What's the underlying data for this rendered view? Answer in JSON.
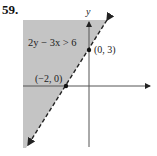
{
  "problem": {
    "number": "59."
  },
  "graph": {
    "inequality": "2y − 3x > 6",
    "axis_labels": {
      "y": "y",
      "x": "x"
    },
    "points": [
      {
        "label": "(0, 3)",
        "x": 0,
        "y": 3
      },
      {
        "label": "(−2, 0)",
        "x": -2,
        "y": 0
      }
    ],
    "boundary_line": {
      "equation": "2y − 3x = 6",
      "style": "dashed"
    },
    "shaded_region": "above-left of boundary",
    "colors": {
      "shade": "#c4c4c4",
      "line": "#222222",
      "axis": "#555555"
    }
  }
}
